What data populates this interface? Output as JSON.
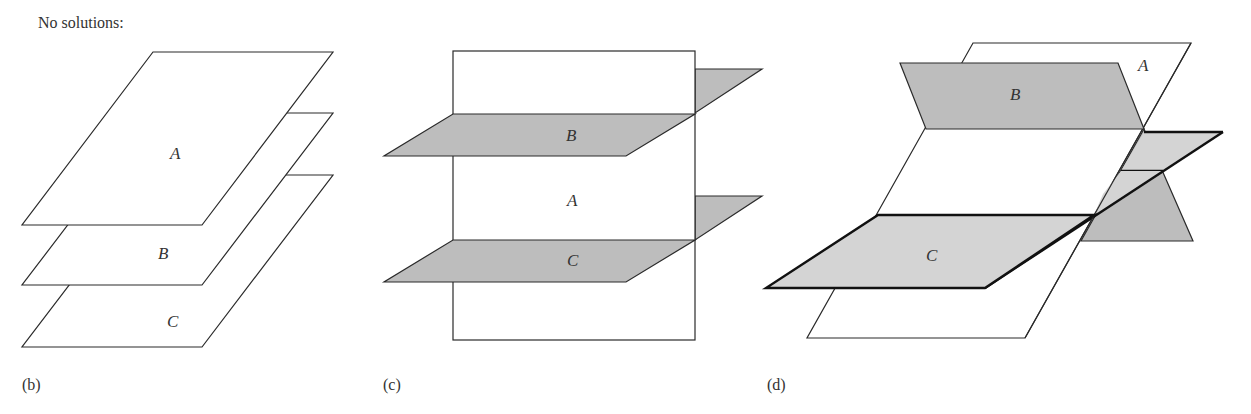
{
  "title": "No solutions:",
  "figures": [
    {
      "id": "b",
      "caption": "(b)",
      "description": "Three parallel planes",
      "planes": [
        {
          "name": "A",
          "fill": "#ffffff"
        },
        {
          "name": "B",
          "fill": "#ffffff"
        },
        {
          "name": "C",
          "fill": "#ffffff"
        }
      ]
    },
    {
      "id": "c",
      "caption": "(c)",
      "description": "Two parallel planes B and C both intersecting plane A",
      "planes": [
        {
          "name": "A",
          "fill": "#ffffff"
        },
        {
          "name": "B",
          "fill": "#bdbdbd"
        },
        {
          "name": "C",
          "fill": "#bdbdbd"
        }
      ]
    },
    {
      "id": "d",
      "caption": "(d)",
      "description": "Three planes intersecting pairwise in three parallel lines",
      "planes": [
        {
          "name": "A",
          "fill": "#ffffff"
        },
        {
          "name": "B",
          "fill": "#bdbdbd"
        },
        {
          "name": "C",
          "fill": "#d4d4d4"
        }
      ]
    }
  ],
  "colors": {
    "stroke": "#2a2a2a",
    "shade_dark": "#bdbdbd",
    "shade_light": "#d4d4d4",
    "background": "#ffffff"
  }
}
